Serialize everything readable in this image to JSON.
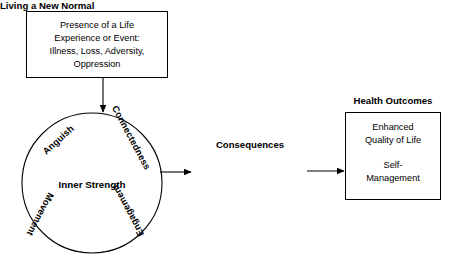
{
  "diagram": {
    "colors": {
      "background": "#ffffff",
      "stroke": "#000000",
      "text": "#000000"
    },
    "life_event_box": {
      "lines": [
        "Presence of a Life",
        "Experience or Event:",
        "Illness, Loss, Adversity,",
        "Oppression"
      ]
    },
    "circle": {
      "center_label": "Inner Strength",
      "perimeter_labels": [
        {
          "text": "Anguish",
          "position": "upper-left"
        },
        {
          "text": "Connectedness",
          "position": "upper-right"
        },
        {
          "text": "Engagement",
          "position": "lower-right"
        },
        {
          "text": "Movement",
          "position": "lower-left"
        }
      ]
    },
    "consequences": {
      "heading": "Consequences",
      "value": "Living a New Normal"
    },
    "health_outcomes": {
      "title": "Health Outcomes",
      "lines_top": [
        "Enhanced",
        "Quality of Life"
      ],
      "lines_bottom": [
        "Self-",
        "Management"
      ]
    },
    "connectors": [
      {
        "name": "box-to-circle",
        "direction": "down"
      },
      {
        "name": "circle-to-consequences",
        "direction": "right"
      },
      {
        "name": "consequences-to-outcomes",
        "direction": "right"
      }
    ]
  }
}
